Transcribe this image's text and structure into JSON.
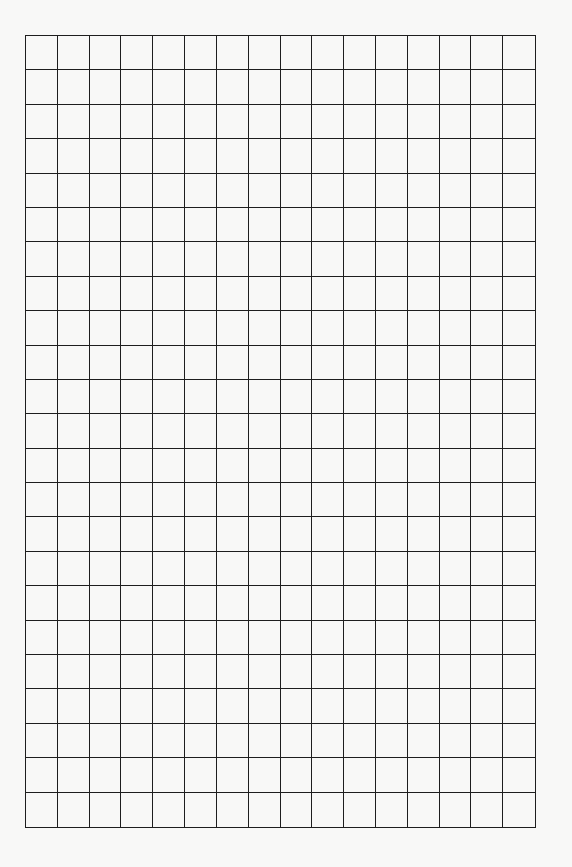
{
  "grid": {
    "columns": 16,
    "rows": 23,
    "line_color": "#1e1e1e",
    "background_color": "#f8f8f7"
  }
}
